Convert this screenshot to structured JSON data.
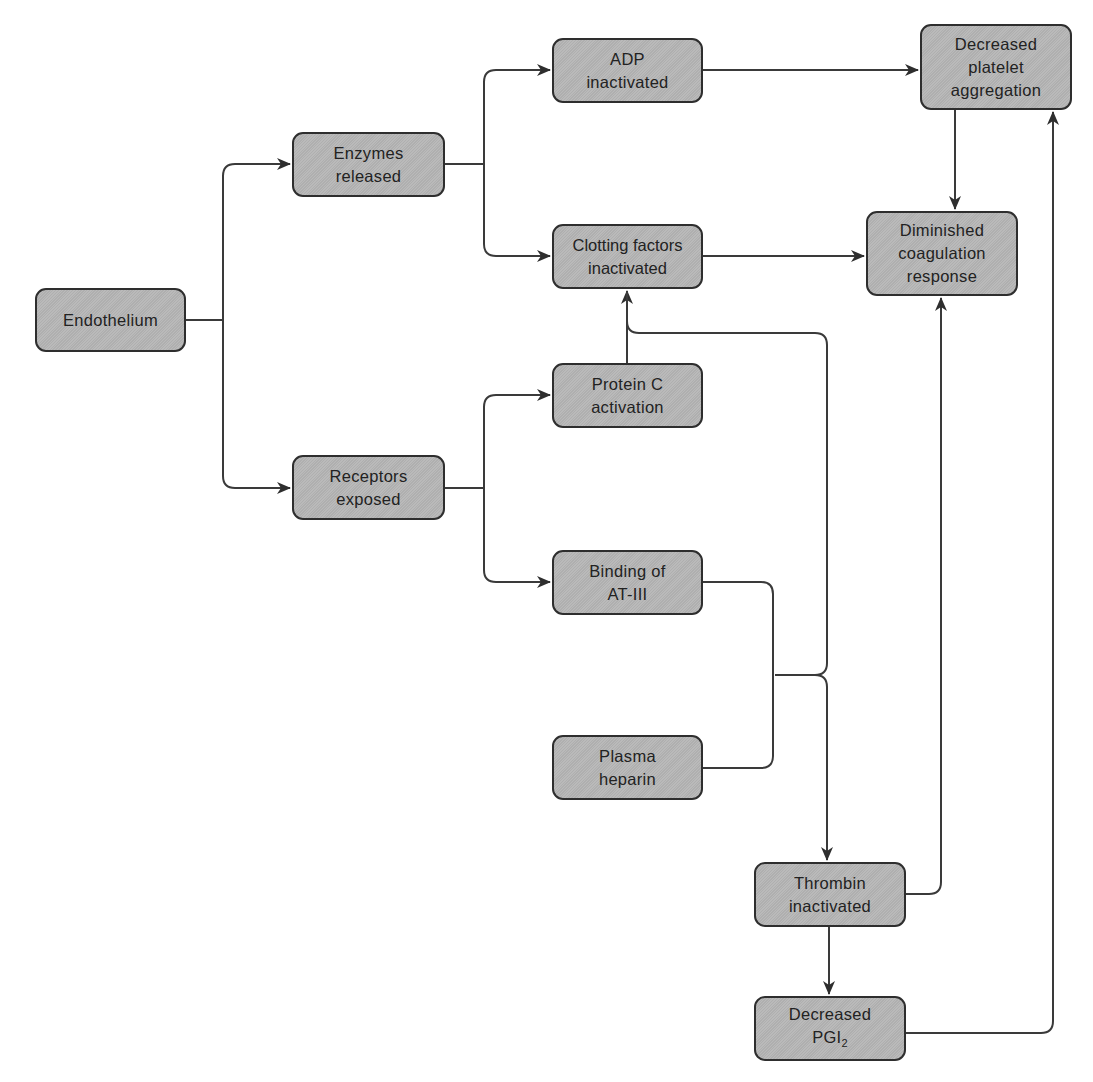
{
  "diagram": {
    "colors": {
      "node_fill": "#b6b6b6",
      "node_border": "#2e2e2e",
      "text": "#222222",
      "edge": "#3a3a3a",
      "background": "#ffffff"
    },
    "nodes": [
      {
        "id": "endothelium",
        "label": "Endothelium",
        "x": 35,
        "y": 288,
        "w": 151,
        "h": 64
      },
      {
        "id": "enzymes",
        "label": "Enzymes\nreleased",
        "x": 292,
        "y": 132,
        "w": 153,
        "h": 65
      },
      {
        "id": "receptors",
        "label": "Receptors\nexposed",
        "x": 292,
        "y": 455,
        "w": 153,
        "h": 65
      },
      {
        "id": "adp",
        "label": "ADP\ninactivated",
        "x": 552,
        "y": 38,
        "w": 151,
        "h": 65
      },
      {
        "id": "clotting",
        "label": "Clotting factors\ninactivated",
        "x": 552,
        "y": 224,
        "w": 151,
        "h": 65
      },
      {
        "id": "proteinc",
        "label": "Protein C\nactivation",
        "x": 552,
        "y": 363,
        "w": 151,
        "h": 65
      },
      {
        "id": "binding",
        "label": "Binding of\nAT-III",
        "x": 552,
        "y": 550,
        "w": 151,
        "h": 65
      },
      {
        "id": "heparin",
        "label": "Plasma\nheparin",
        "x": 552,
        "y": 735,
        "w": 151,
        "h": 65
      },
      {
        "id": "platelet",
        "label": "Decreased\nplatelet\naggregation",
        "x": 920,
        "y": 24,
        "w": 152,
        "h": 86
      },
      {
        "id": "diminished",
        "label": "Diminished\ncoagulation\nresponse",
        "x": 866,
        "y": 211,
        "w": 152,
        "h": 85
      },
      {
        "id": "thrombin",
        "label": "Thrombin\ninactivated",
        "x": 754,
        "y": 862,
        "w": 152,
        "h": 65
      },
      {
        "id": "pgi2",
        "label": "Decreased\nPGI",
        "subscript": "2",
        "x": 754,
        "y": 996,
        "w": 152,
        "h": 65
      }
    ],
    "edges": [
      {
        "from": "endothelium",
        "to": "enzymes"
      },
      {
        "from": "endothelium",
        "to": "receptors"
      },
      {
        "from": "enzymes",
        "to": "adp"
      },
      {
        "from": "enzymes",
        "to": "clotting"
      },
      {
        "from": "receptors",
        "to": "proteinc"
      },
      {
        "from": "receptors",
        "to": "binding"
      },
      {
        "from": "proteinc",
        "to": "clotting"
      },
      {
        "from": [
          "binding",
          "heparin"
        ],
        "to": "clotting"
      },
      {
        "from": [
          "binding",
          "heparin"
        ],
        "to": "thrombin"
      },
      {
        "from": "adp",
        "to": "platelet"
      },
      {
        "from": "clotting",
        "to": "diminished"
      },
      {
        "from": "platelet",
        "to": "diminished"
      },
      {
        "from": "thrombin",
        "to": "diminished"
      },
      {
        "from": "thrombin",
        "to": "pgi2"
      },
      {
        "from": "pgi2",
        "to": "platelet"
      }
    ]
  }
}
